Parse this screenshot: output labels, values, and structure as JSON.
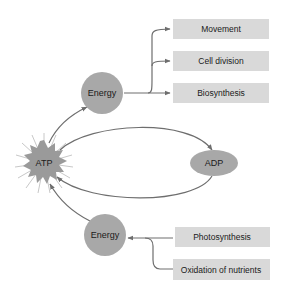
{
  "diagram": {
    "atp": {
      "label": "ATP",
      "color": "#9a9a9a"
    },
    "adp": {
      "label": "ADP",
      "color": "#a8a8a8"
    },
    "energy_top": {
      "label": "Energy",
      "color": "#a8a8a8"
    },
    "energy_bottom": {
      "label": "Energy",
      "color": "#a8a8a8"
    },
    "outputs": [
      {
        "label": "Movement"
      },
      {
        "label": "Cell division"
      },
      {
        "label": "Biosynthesis"
      }
    ],
    "inputs": [
      {
        "label": "Photosynthesis"
      },
      {
        "label": "Oxidation of nutrients"
      }
    ],
    "colors": {
      "box": "#d9d9d9",
      "line": "#6e6e6e"
    }
  }
}
